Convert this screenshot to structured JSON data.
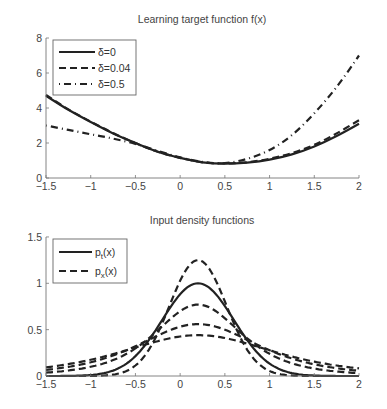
{
  "chart_data": [
    {
      "type": "line",
      "title": "Learning target function f(x)",
      "xlabel": "",
      "ylabel": "",
      "xlim": [
        -1.5,
        2
      ],
      "ylim": [
        0,
        8
      ],
      "xticks": [
        "-1.5",
        "-1",
        "-0.5",
        "0",
        "0.5",
        "1",
        "1.5",
        "2"
      ],
      "yticks": [
        "0",
        "2",
        "4",
        "6",
        "8"
      ],
      "grid": false,
      "legend_position": "upper left",
      "x": [
        -1.5,
        -1.25,
        -1.0,
        -0.75,
        -0.5,
        -0.25,
        0.0,
        0.25,
        0.5,
        0.75,
        1.0,
        1.25,
        1.5,
        1.75,
        2.0
      ],
      "series": [
        {
          "name": "δ=0",
          "style": "solid",
          "values": [
            4.7,
            3.9,
            3.2,
            2.55,
            2.0,
            1.5,
            1.15,
            0.9,
            0.82,
            0.88,
            1.05,
            1.35,
            1.8,
            2.4,
            3.1
          ]
        },
        {
          "name": "δ=0.04",
          "style": "dashed",
          "values": [
            4.75,
            3.92,
            3.22,
            2.57,
            2.0,
            1.5,
            1.15,
            0.9,
            0.83,
            0.9,
            1.1,
            1.42,
            1.9,
            2.55,
            3.3
          ]
        },
        {
          "name": "δ=0.5",
          "style": "dashdot",
          "values": [
            3.0,
            2.75,
            2.5,
            2.25,
            1.95,
            1.55,
            1.18,
            0.92,
            0.85,
            1.1,
            1.6,
            2.45,
            3.7,
            5.2,
            7.0
          ]
        }
      ]
    },
    {
      "type": "line",
      "title": "Input density functions",
      "xlabel": "",
      "ylabel": "",
      "xlim": [
        -1.5,
        2
      ],
      "ylim": [
        0,
        1.5
      ],
      "xticks": [
        "-1.5",
        "-1",
        "-0.5",
        "0",
        "0.5",
        "1",
        "1.5",
        "2"
      ],
      "yticks": [
        "0",
        "0.5",
        "1",
        "1.5"
      ],
      "grid": false,
      "legend_position": "upper left",
      "legend": [
        {
          "label": "p_t(x)",
          "base": "p",
          "sub": "t",
          "suffix": "(x)",
          "style": "solid"
        },
        {
          "label": "p_x(x)",
          "base": "p",
          "sub": "x",
          "suffix": "(x)",
          "style": "dashed"
        }
      ],
      "series": [
        {
          "name": "p_t(x)",
          "style": "solid",
          "mean": 0.2,
          "peak": 1.0
        },
        {
          "name": "p_x(x) #1",
          "style": "dashed",
          "mean": 0.2,
          "peak": 1.25
        },
        {
          "name": "p_x(x) #2",
          "style": "dashed",
          "mean": 0.2,
          "peak": 0.77
        },
        {
          "name": "p_x(x) #3",
          "style": "dashed",
          "mean": 0.2,
          "peak": 0.56
        },
        {
          "name": "p_x(x) #4",
          "style": "dashed",
          "mean": 0.2,
          "peak": 0.44
        }
      ]
    }
  ],
  "plots": {
    "top": {
      "title": "Learning target function f(x)",
      "legend": [
        "δ=0",
        "δ=0.04",
        "δ=0.5"
      ]
    },
    "bottom": {
      "title": "Input density functions"
    }
  }
}
